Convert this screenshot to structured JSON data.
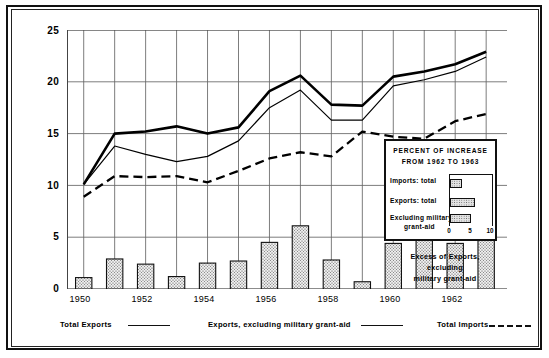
{
  "chart_data": {
    "type": "line",
    "title": "",
    "xlabel": "",
    "ylabel": "BILLIONS OF DOLLARS",
    "ylim": [
      0,
      25
    ],
    "yticks": [
      0,
      5,
      10,
      15,
      20,
      25
    ],
    "grid": true,
    "x": [
      1950,
      1951,
      1952,
      1953,
      1954,
      1955,
      1956,
      1957,
      1958,
      1959,
      1960,
      1961,
      1962,
      1963
    ],
    "xtick_labels": [
      "1950",
      "1952",
      "1954",
      "1956",
      "1958",
      "1960",
      "1962"
    ],
    "xtick_values": [
      1950,
      1952,
      1954,
      1956,
      1958,
      1960,
      1962
    ],
    "series": [
      {
        "name": "Total Exports",
        "style": "thick-solid",
        "values": [
          10.1,
          15.0,
          15.2,
          15.7,
          15.0,
          15.6,
          19.1,
          20.6,
          17.8,
          17.7,
          20.5,
          21.0,
          21.7,
          22.9
        ]
      },
      {
        "name": "Exports, excluding military grant-aid",
        "style": "thin-solid",
        "values": [
          10.1,
          13.8,
          13.0,
          12.3,
          12.8,
          14.3,
          17.5,
          19.2,
          16.3,
          16.3,
          19.6,
          20.2,
          21.0,
          22.4
        ]
      },
      {
        "name": "Total Imports",
        "style": "dashed",
        "values": [
          8.9,
          10.9,
          10.8,
          10.9,
          10.3,
          11.4,
          12.6,
          13.2,
          12.8,
          15.2,
          14.7,
          14.5,
          16.2,
          16.9
        ]
      }
    ],
    "bars": {
      "name": "Excess of Exports, excluding military grant-aid",
      "values": [
        1.1,
        2.9,
        2.4,
        1.2,
        2.5,
        2.7,
        4.5,
        6.1,
        2.8,
        0.7,
        4.4,
        5.2,
        4.4,
        4.9
      ],
      "fill": "stippled"
    }
  },
  "axis": {
    "y_title": "BILLIONS OF DOLLARS",
    "y_labels": [
      "25",
      "20",
      "15",
      "10",
      "5",
      "0"
    ],
    "x_labels": [
      "1950",
      "1952",
      "1954",
      "1956",
      "1958",
      "1960",
      "1962"
    ]
  },
  "inset": {
    "title_line1": "PERCENT OF INCREASE",
    "title_line2": "FROM 1962 TO 1963",
    "rows": [
      {
        "label": "Imports: total",
        "value": 3.0
      },
      {
        "label": "Exports: total",
        "value": 6.0
      },
      {
        "label_line1": "Excluding  military",
        "label_line2": "grant-aid",
        "value": 5.0
      }
    ],
    "scale_ticks": [
      "0",
      "5",
      "10"
    ],
    "scale_max": 10
  },
  "bar_caption": {
    "line1": "Excess of Exports,",
    "line2": "excluding",
    "line3": "military grant-aid"
  },
  "key": {
    "items": [
      {
        "label": "Total Exports",
        "style": "solid"
      },
      {
        "label": "Exports, excluding military grant-aid",
        "style": "solid"
      },
      {
        "label": "Total Imports",
        "style": "dashed"
      }
    ]
  }
}
